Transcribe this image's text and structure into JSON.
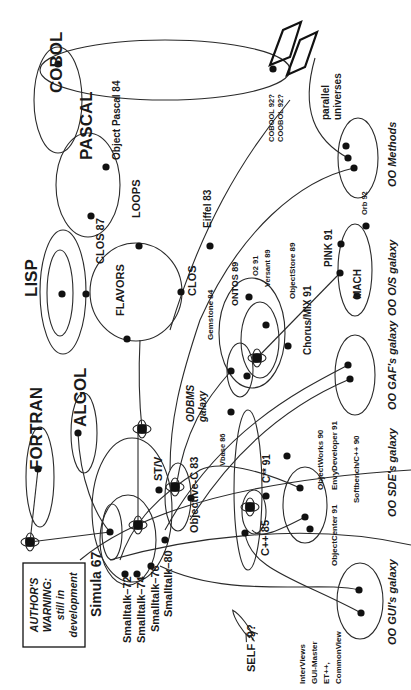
{
  "diagram": {
    "rotation_deg": -90,
    "ink_color": "#1a1a1a",
    "background": "#ffffff"
  },
  "warning_box": {
    "lines": [
      "AUTHOR'S",
      "WARNING:",
      "still in",
      "development"
    ]
  },
  "labels": [
    {
      "id": "cobol",
      "text": "COBOL",
      "x": 62,
      "y": 93,
      "size": 17,
      "italic": false
    },
    {
      "id": "pascal",
      "text": "PASCAL",
      "x": 92,
      "y": 160,
      "size": 17,
      "italic": false
    },
    {
      "id": "object-pascal",
      "text": "Object Pascal  84",
      "x": 120,
      "y": 160,
      "size": 10,
      "italic": false
    },
    {
      "id": "loops",
      "text": "LOOPS",
      "x": 140,
      "y": 218,
      "size": 11,
      "italic": false
    },
    {
      "id": "clos87",
      "text": "CLOS 87",
      "x": 104,
      "y": 264,
      "size": 11,
      "italic": false
    },
    {
      "id": "lisp",
      "text": "LISP",
      "x": 37,
      "y": 297,
      "size": 17,
      "italic": false
    },
    {
      "id": "flavors",
      "text": "FLAVORS",
      "x": 124,
      "y": 316,
      "size": 11,
      "italic": false
    },
    {
      "id": "clos",
      "text": "CLOS",
      "x": 196,
      "y": 296,
      "size": 11,
      "italic": false
    },
    {
      "id": "eiffel",
      "text": "Eiffel  83",
      "x": 211,
      "y": 228,
      "size": 10,
      "italic": false
    },
    {
      "id": "cobool",
      "text": "COBOOL  92?",
      "x": 274,
      "y": 142,
      "size": 7.5,
      "italic": false
    },
    {
      "id": "coobol",
      "text": "COOBOL  92?",
      "x": 283,
      "y": 142,
      "size": 7.5,
      "italic": false
    },
    {
      "id": "parallel",
      "text": "parallel",
      "x": 329,
      "y": 120,
      "size": 10,
      "italic": false
    },
    {
      "id": "universes",
      "text": "universes",
      "x": 341,
      "y": 120,
      "size": 10,
      "italic": false
    },
    {
      "id": "oo-methods",
      "text": "OO Methods",
      "x": 396,
      "y": 187,
      "size": 11,
      "italic": true
    },
    {
      "id": "orb92",
      "text": "Orb 92",
      "x": 367,
      "y": 215,
      "size": 7.5,
      "italic": false
    },
    {
      "id": "pink91",
      "text": "PINK  91",
      "x": 332,
      "y": 267,
      "size": 10,
      "italic": false
    },
    {
      "id": "mach",
      "text": "MACH",
      "x": 361,
      "y": 299,
      "size": 10,
      "italic": false
    },
    {
      "id": "oo-os",
      "text": "OO O/S galaxy",
      "x": 396,
      "y": 316,
      "size": 11,
      "italic": true
    },
    {
      "id": "chorus",
      "text": "Chorus/MIX  91",
      "x": 311,
      "y": 355,
      "size": 10,
      "italic": false
    },
    {
      "id": "o2",
      "text": "O2  91",
      "x": 258,
      "y": 276,
      "size": 7.5,
      "italic": false
    },
    {
      "id": "versant",
      "text": "Versant  89",
      "x": 270,
      "y": 287,
      "size": 7.5,
      "italic": false
    },
    {
      "id": "objectstore",
      "text": "ObjectStore  89",
      "x": 295,
      "y": 299,
      "size": 8,
      "italic": false
    },
    {
      "id": "ontos",
      "text": "ONTOS  89",
      "x": 238,
      "y": 306,
      "size": 9,
      "italic": false
    },
    {
      "id": "gemstone",
      "text": "Gemstone  84",
      "x": 213,
      "y": 340,
      "size": 8,
      "italic": false
    },
    {
      "id": "oo-gaf",
      "text": "OO GAF's galaxy",
      "x": 396,
      "y": 410,
      "size": 11,
      "italic": true
    },
    {
      "id": "odbms",
      "text": "ODBMS",
      "x": 194,
      "y": 422,
      "size": 10,
      "italic": true
    },
    {
      "id": "galaxy-odbms",
      "text": "galaxy",
      "x": 206,
      "y": 422,
      "size": 10,
      "italic": true
    },
    {
      "id": "vbase",
      "text": "Vbase  86",
      "x": 225,
      "y": 466,
      "size": 7.5,
      "italic": false
    },
    {
      "id": "cplusplus91",
      "text": "C** 91",
      "x": 270,
      "y": 483,
      "size": 10,
      "italic": false
    },
    {
      "id": "objectworks",
      "text": "ObjectWorks  90",
      "x": 323,
      "y": 490,
      "size": 8,
      "italic": false
    },
    {
      "id": "envy",
      "text": "EnvyDeveloper 91",
      "x": 337,
      "y": 490,
      "size": 8,
      "italic": false
    },
    {
      "id": "softbench",
      "text": "Softbench/C++  90",
      "x": 359,
      "y": 503,
      "size": 8,
      "italic": false
    },
    {
      "id": "oo-sde",
      "text": "OO SDE's galaxy",
      "x": 396,
      "y": 517,
      "size": 11,
      "italic": true
    },
    {
      "id": "stv",
      "text": "ST/V",
      "x": 162,
      "y": 481,
      "size": 11,
      "italic": false
    },
    {
      "id": "objective-c",
      "text": "Objective-C  83",
      "x": 198,
      "y": 533,
      "size": 11,
      "italic": false
    },
    {
      "id": "cplusplus85",
      "text": "C++  85",
      "x": 269,
      "y": 556,
      "size": 11,
      "italic": false
    },
    {
      "id": "objectcenter",
      "text": "ObjectCenter  91",
      "x": 337,
      "y": 566,
      "size": 8,
      "italic": false
    },
    {
      "id": "fortran",
      "text": "FORTRAN",
      "x": 42,
      "y": 470,
      "size": 17,
      "italic": false
    },
    {
      "id": "algol",
      "text": "ALGOL",
      "x": 86,
      "y": 427,
      "size": 17,
      "italic": false
    },
    {
      "id": "simula",
      "text": "Simula 67",
      "x": 101,
      "y": 617,
      "size": 14,
      "italic": false
    },
    {
      "id": "st72",
      "text": "Smalltalk–72",
      "x": 131,
      "y": 643,
      "size": 11,
      "italic": false
    },
    {
      "id": "st74",
      "text": "Smalltalk–74",
      "x": 145,
      "y": 643,
      "size": 11,
      "italic": false
    },
    {
      "id": "st76",
      "text": "Smalltalk–76",
      "x": 159,
      "y": 632,
      "size": 11,
      "italic": false
    },
    {
      "id": "st80",
      "text": "Smalltalk–80",
      "x": 172,
      "y": 617,
      "size": 11,
      "italic": false
    },
    {
      "id": "self",
      "text": "SELF  -9?",
      "x": 255,
      "y": 672,
      "size": 11,
      "italic": false
    },
    {
      "id": "interviews",
      "text": "InterViews",
      "x": 305,
      "y": 684,
      "size": 8,
      "italic": false
    },
    {
      "id": "guimaster",
      "text": "GUI-Master",
      "x": 317,
      "y": 684,
      "size": 8,
      "italic": false
    },
    {
      "id": "etpp",
      "text": "ET++,",
      "x": 329,
      "y": 684,
      "size": 8,
      "italic": false
    },
    {
      "id": "commonview",
      "text": "CommonView",
      "x": 341,
      "y": 684,
      "size": 8,
      "italic": false
    },
    {
      "id": "oo-gui",
      "text": "OO GUI's galaxy",
      "x": 396,
      "y": 645,
      "size": 11,
      "italic": true
    }
  ],
  "nodes": [
    {
      "x": 58,
      "y": 64
    },
    {
      "x": 273,
      "y": 69
    },
    {
      "x": 91,
      "y": 216
    },
    {
      "x": 106,
      "y": 167
    },
    {
      "x": 139,
      "y": 246
    },
    {
      "x": 62,
      "y": 294
    },
    {
      "x": 86,
      "y": 294
    },
    {
      "x": 127,
      "y": 339
    },
    {
      "x": 181,
      "y": 292
    },
    {
      "x": 210,
      "y": 246
    },
    {
      "x": 346,
      "y": 146
    },
    {
      "x": 348,
      "y": 158
    },
    {
      "x": 354,
      "y": 168
    },
    {
      "x": 366,
      "y": 226
    },
    {
      "x": 341,
      "y": 244
    },
    {
      "x": 340,
      "y": 273
    },
    {
      "x": 357,
      "y": 296
    },
    {
      "x": 348,
      "y": 365
    },
    {
      "x": 350,
      "y": 379
    },
    {
      "x": 249,
      "y": 297
    },
    {
      "x": 266,
      "y": 325
    },
    {
      "x": 288,
      "y": 346
    },
    {
      "x": 231,
      "y": 371
    },
    {
      "x": 247,
      "y": 376
    },
    {
      "x": 231,
      "y": 412
    },
    {
      "x": 266,
      "y": 496
    },
    {
      "x": 245,
      "y": 533
    },
    {
      "x": 287,
      "y": 456
    },
    {
      "x": 300,
      "y": 488
    },
    {
      "x": 305,
      "y": 517
    },
    {
      "x": 310,
      "y": 529
    },
    {
      "x": 159,
      "y": 490
    },
    {
      "x": 191,
      "y": 498
    },
    {
      "x": 165,
      "y": 540
    },
    {
      "x": 38,
      "y": 469
    },
    {
      "x": 78,
      "y": 433
    },
    {
      "x": 110,
      "y": 532
    },
    {
      "x": 125,
      "y": 574
    },
    {
      "x": 137,
      "y": 574
    },
    {
      "x": 151,
      "y": 566
    },
    {
      "x": 359,
      "y": 590
    },
    {
      "x": 361,
      "y": 613
    }
  ],
  "atoms": [
    {
      "x": 142,
      "y": 429
    },
    {
      "x": 175,
      "y": 487
    },
    {
      "x": 138,
      "y": 525
    },
    {
      "x": 250,
      "y": 507
    },
    {
      "x": 257,
      "y": 358
    },
    {
      "x": 30,
      "y": 542
    }
  ]
}
